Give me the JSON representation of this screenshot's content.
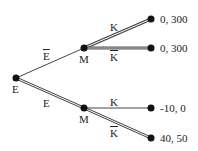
{
  "diagram": {
    "type": "game-tree",
    "nodes": {
      "root": {
        "label": "E",
        "x": 16,
        "y": 78
      },
      "m_upper": {
        "label": "M",
        "x": 84,
        "y": 48
      },
      "m_lower": {
        "label": "M",
        "x": 84,
        "y": 108
      },
      "leaf1": {
        "x": 151,
        "y": 19,
        "payoff": "0, 300"
      },
      "leaf2": {
        "x": 151,
        "y": 48,
        "payoff": "0, 300"
      },
      "leaf3": {
        "x": 151,
        "y": 108,
        "payoff": "-10, 0"
      },
      "leaf4": {
        "x": 151,
        "y": 138,
        "payoff": "40, 50"
      }
    },
    "edges": [
      {
        "from": "root",
        "to": "m_upper",
        "label": "E",
        "label_overline": true,
        "double": false
      },
      {
        "from": "root",
        "to": "m_lower",
        "label": "E",
        "label_overline": false,
        "double": true
      },
      {
        "from": "m_upper",
        "to": "leaf1",
        "label": "K",
        "label_overline": false,
        "double": true
      },
      {
        "from": "m_upper",
        "to": "leaf2",
        "label": "K",
        "label_overline": true,
        "double": true
      },
      {
        "from": "m_lower",
        "to": "leaf3",
        "label": "K",
        "label_overline": false,
        "double": false
      },
      {
        "from": "m_lower",
        "to": "leaf4",
        "label": "K",
        "label_overline": true,
        "double": true
      }
    ],
    "colors": {
      "line": "#333333",
      "node": "#111111"
    }
  }
}
